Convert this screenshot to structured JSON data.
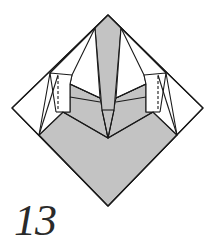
{
  "diagram": {
    "step_number": "13",
    "colors": {
      "paper_colored": "#c3c3c3",
      "paper_white": "#ffffff",
      "line": "#1a1a1a"
    },
    "elements": [
      "outer-diamond",
      "central-spike-flap",
      "left-side-flap",
      "right-side-flap",
      "valley-fold-line-left",
      "valley-fold-line-right",
      "colored-bottom-region"
    ]
  }
}
